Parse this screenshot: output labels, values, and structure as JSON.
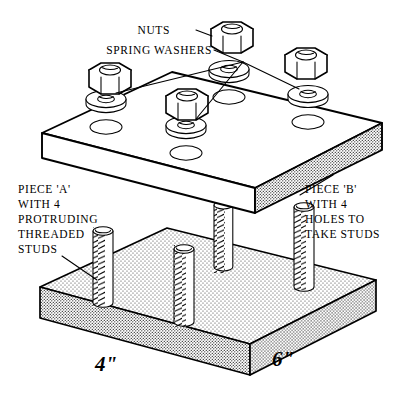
{
  "diagram": {
    "background_color": "#ffffff",
    "line_color": "#000000",
    "labels": {
      "nuts": "NUTS",
      "spring_washers": "SPRING WASHERS",
      "piece_a_line1": "PIECE 'A'",
      "piece_a_line2": "WITH 4",
      "piece_a_line3": "PROTRUDING",
      "piece_a_line4": "THREADED",
      "piece_a_line5": "STUDS",
      "piece_b_line1": "PIECE 'B'",
      "piece_b_line2": "WITH 4",
      "piece_b_line3": "HOLES TO",
      "piece_b_line4": "TAKE STUDS"
    },
    "dimensions": {
      "width_short": "4\"",
      "width_long": "6\""
    },
    "parts": {
      "nut_count": 4,
      "washer_count": 4,
      "hole_count": 4,
      "stud_count": 4,
      "plate_top_name": "PIECE 'B'",
      "plate_bottom_name": "PIECE 'A'"
    }
  }
}
